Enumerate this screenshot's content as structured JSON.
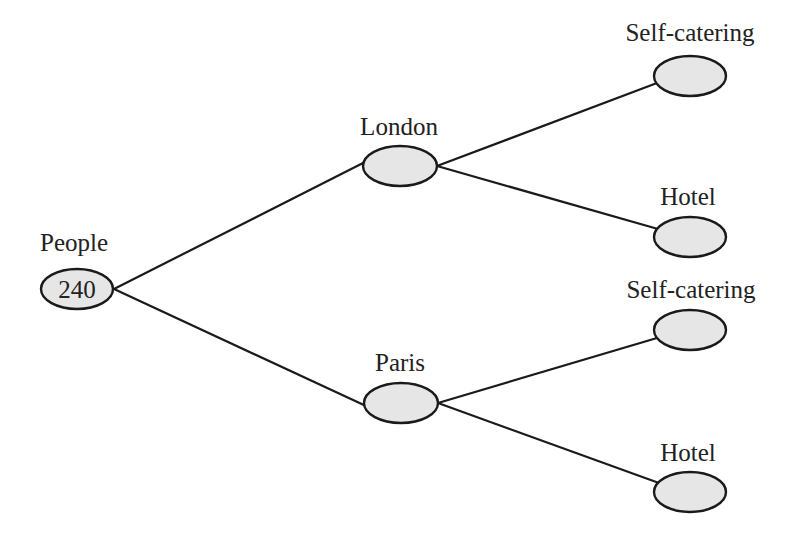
{
  "diagram": {
    "type": "tree-diagram",
    "colors": {
      "line": "#1a1a1a",
      "node_fill": "#e6e6e6",
      "text": "#222222"
    },
    "root": {
      "label": "People",
      "value": "240"
    },
    "branches": [
      {
        "label": "London",
        "children": [
          {
            "label": "Self-catering",
            "value": ""
          },
          {
            "label": "Hotel",
            "value": ""
          }
        ]
      },
      {
        "label": "Paris",
        "children": [
          {
            "label": "Self-catering",
            "value": ""
          },
          {
            "label": "Hotel",
            "value": ""
          }
        ]
      }
    ]
  }
}
